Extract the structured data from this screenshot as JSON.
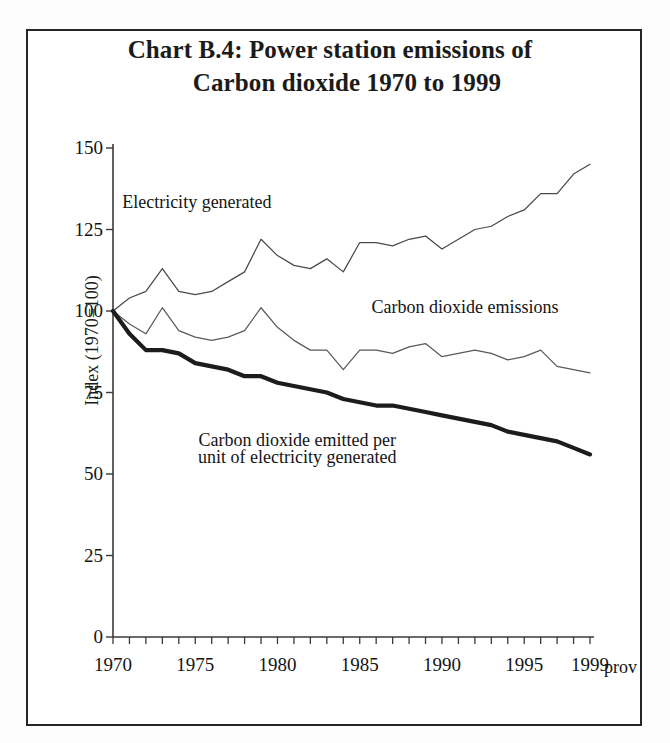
{
  "chart_data": {
    "type": "line",
    "title": "Chart B.4:  Power station emissions of Carbon dioxide 1970 to 1999",
    "title_line1": "Chart B.4:  Power station emissions of",
    "title_line2": "Carbon dioxide 1970 to 1999",
    "xlabel": "",
    "ylabel": "Index (1970=100)",
    "ylim": [
      0,
      150
    ],
    "xlim": [
      1970,
      1999
    ],
    "yticks": [
      150,
      125,
      100,
      75,
      50,
      25,
      0
    ],
    "xticks": [
      1970,
      1975,
      1980,
      1985,
      1990,
      1995,
      1999
    ],
    "x_axis_note": "prov",
    "grid": false,
    "legend": "inline-annotations",
    "x": [
      1970,
      1971,
      1972,
      1973,
      1974,
      1975,
      1976,
      1977,
      1978,
      1979,
      1980,
      1981,
      1982,
      1983,
      1984,
      1985,
      1986,
      1987,
      1988,
      1989,
      1990,
      1991,
      1992,
      1993,
      1994,
      1995,
      1996,
      1997,
      1998,
      1999
    ],
    "series": [
      {
        "name": "Electricity generated",
        "style": "thin",
        "color": "#4a4a4a",
        "values": [
          100,
          104,
          106,
          113,
          106,
          105,
          106,
          109,
          112,
          122,
          117,
          114,
          113,
          116,
          112,
          121,
          121,
          120,
          122,
          123,
          119,
          122,
          125,
          126,
          129,
          131,
          136,
          136,
          142,
          145
        ]
      },
      {
        "name": "Carbon dioxide emissions",
        "style": "thin",
        "color": "#5a5a5a",
        "values": [
          100,
          96,
          93,
          101,
          94,
          92,
          91,
          92,
          94,
          101,
          95,
          91,
          88,
          88,
          82,
          88,
          88,
          87,
          89,
          90,
          86,
          87,
          88,
          87,
          85,
          86,
          88,
          83,
          82,
          81
        ]
      },
      {
        "name": "Carbon dioxide emitted per unit of electricity generated",
        "style": "bold",
        "color": "#1c1c1c",
        "values": [
          100,
          93,
          88,
          88,
          87,
          84,
          83,
          82,
          80,
          80,
          78,
          77,
          76,
          75,
          73,
          72,
          71,
          71,
          70,
          69,
          68,
          67,
          66,
          65,
          63,
          62,
          61,
          60,
          58,
          56
        ]
      }
    ],
    "annotations": [
      {
        "text": "Electricity generated",
        "x": 1975.1,
        "y": 133
      },
      {
        "text": "Carbon dioxide emissions",
        "x": 1991.4,
        "y": 101
      },
      {
        "text": "Carbon dioxide emitted per",
        "x": 1981.2,
        "y": 60
      },
      {
        "text": "unit of electricity generated",
        "x": 1981.2,
        "y": 55
      }
    ]
  }
}
